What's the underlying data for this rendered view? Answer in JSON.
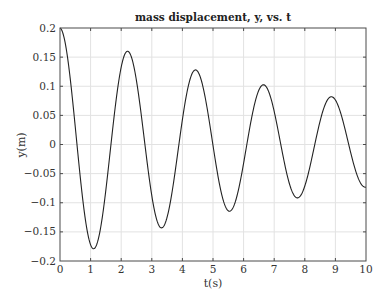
{
  "chart_data": {
    "type": "line",
    "title": "mass displacement, y, vs. t",
    "xlabel": "t(s)",
    "ylabel": "y(m)",
    "xlim": [
      0,
      10
    ],
    "ylim": [
      -0.2,
      0.2
    ],
    "grid": true,
    "xticks": [
      0,
      1,
      2,
      3,
      4,
      5,
      6,
      7,
      8,
      9,
      10
    ],
    "xtick_labels": [
      "0",
      "1",
      "2",
      "3",
      "4",
      "5",
      "6",
      "7",
      "8",
      "9",
      "10"
    ],
    "yticks": [
      0.2,
      0.15,
      0.1,
      0.05,
      0,
      -0.05,
      -0.1,
      -0.15,
      -0.2
    ],
    "ytick_labels": [
      "0.2",
      "0.15",
      "0.1",
      "0.05",
      "0",
      "−0.05",
      "−0.1",
      "−0.15",
      "−0.2"
    ],
    "series": [
      {
        "name": "y(t)",
        "model": "damped cosine y = A*exp(-d*t)*cos(w*t)",
        "A": 0.2,
        "d": 0.1005,
        "w": 2.83,
        "t_range": [
          0,
          10
        ],
        "key_points": [
          {
            "t": 0,
            "y": 0.2
          },
          {
            "t": 1.11,
            "y": -0.178
          },
          {
            "t": 2.22,
            "y": 0.16
          },
          {
            "t": 3.33,
            "y": -0.143
          },
          {
            "t": 4.44,
            "y": 0.128
          },
          {
            "t": 5.55,
            "y": -0.114
          },
          {
            "t": 6.66,
            "y": 0.102
          },
          {
            "t": 7.77,
            "y": -0.091
          },
          {
            "t": 8.88,
            "y": 0.082
          },
          {
            "t": 10,
            "y": -0.074
          }
        ]
      }
    ]
  }
}
